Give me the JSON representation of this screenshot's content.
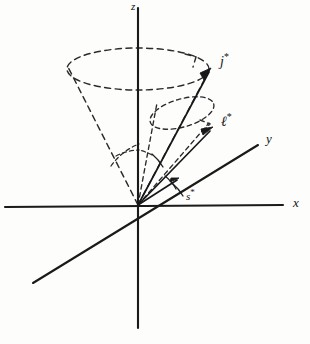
{
  "figure": {
    "kind": "hand-drawn-vector-diagram",
    "background_color": "#fdfdfc",
    "ink_color": "#18181a",
    "width": 310,
    "height": 344
  },
  "axes": {
    "origin": {
      "x": 138,
      "y": 205
    },
    "items": [
      {
        "id": "z",
        "label": "z",
        "label_x": 131,
        "label_y": 1,
        "description": "vertical axis, drawn through origin from top to bottom",
        "x1": 138,
        "y1": 8,
        "x2": 138,
        "y2": 328
      },
      {
        "id": "x",
        "label": "x",
        "label_x": 293,
        "label_y": 196,
        "description": "horizontal axis, drawn through origin left to right",
        "x1": 5,
        "y1": 207,
        "x2": 283,
        "y2": 205
      },
      {
        "id": "y",
        "label": "y",
        "label_x": 266,
        "label_y": 132,
        "description": "oblique axis from lower-left to upper-right through origin",
        "x1": 33,
        "y1": 283,
        "x2": 258,
        "y2": 145
      }
    ]
  },
  "vectors": [
    {
      "id": "j-star",
      "label": "j",
      "superscript": "*",
      "label_x": 220,
      "label_y": 52,
      "tip_x": 211,
      "tip_y": 69,
      "description": "total angular momentum vector, longest, precesses on the large cone"
    },
    {
      "id": "l-star",
      "label": "ℓ",
      "superscript": "*",
      "label_x": 221,
      "label_y": 112,
      "tip_x": 212,
      "tip_y": 128,
      "description": "orbital angular momentum vector, precesses on the small cone about j*"
    },
    {
      "id": "s-star",
      "label": "s",
      "superscript": "*",
      "label_x": 186,
      "label_y": 188,
      "tip_x": 178,
      "tip_y": 178,
      "description": "spin angular momentum vector, short, near the x axis"
    }
  ],
  "cones": [
    {
      "id": "large-precession-cone",
      "style": "dashed",
      "apex_x": 138,
      "apex_y": 205,
      "ellipse_cx": 138,
      "ellipse_cy": 69,
      "ellipse_rx": 71,
      "ellipse_ry": 21,
      "description": "large dashed precession cone about the z axis with an arrowhead on the rim showing the sense of precession"
    },
    {
      "id": "small-precession-cone",
      "style": "dashed",
      "apex_x": 138,
      "apex_y": 205,
      "ellipse_cx": 182,
      "ellipse_cy": 113,
      "ellipse_rx": 33,
      "ellipse_ry": 14,
      "description": "small dashed precession cone of l* about j* with an arrowhead on the rim"
    }
  ],
  "angle_arcs": [
    {
      "id": "arc-z-to-cone",
      "style": "dashed",
      "description": "dashed arc at origin between the z axis and the large cone edge"
    },
    {
      "id": "arc-j-to-l",
      "style": "dashed",
      "description": "dashed arc at origin between j* and l*"
    },
    {
      "id": "arc-s-to-x",
      "style": "solid",
      "description": "narrow solid wedge at origin marking the s* angle above the x axis"
    }
  ],
  "legend": {
    "note": "Hand-drawn textbook figure: j*, l* and s* vectors from a common origin with dashed precession cones."
  }
}
